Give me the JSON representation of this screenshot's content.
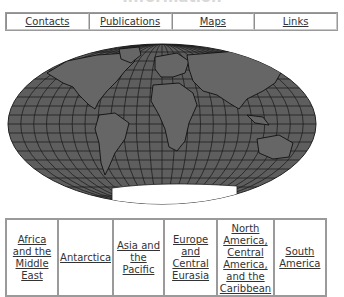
{
  "page": {
    "title": "Information"
  },
  "nav": {
    "items": [
      {
        "label": "Contacts"
      },
      {
        "label": "Publications"
      },
      {
        "label": "Maps"
      },
      {
        "label": "Links"
      }
    ]
  },
  "map": {
    "description": "World map, Mollweide projection",
    "land_color": "#5a5a5a",
    "line_color": "#1a1a1a",
    "antarctica_color": "#ffffff"
  },
  "regions": {
    "items": [
      {
        "label": "Africa and the Middle East"
      },
      {
        "label": "Antarctica"
      },
      {
        "label": "Asia and the Pacific"
      },
      {
        "label": "Europe and Central Eurasia"
      },
      {
        "label": "North America, Central America, and the Caribbean"
      },
      {
        "label": "South America"
      }
    ]
  }
}
